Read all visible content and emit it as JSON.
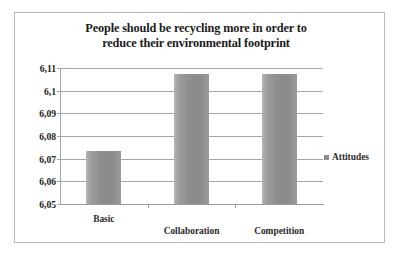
{
  "figure": {
    "border_color": "#b9b9b9",
    "background": "#ffffff"
  },
  "chart_data": {
    "type": "bar",
    "title": "People should be recycling more in order to reduce their environmental footprint",
    "title_lines": [
      "People should be recycling more in order to",
      "reduce their environmental footprint"
    ],
    "categories": [
      "Basic",
      "Collaboration",
      "Competition"
    ],
    "series": [
      {
        "name": "Attitudes",
        "values": [
          6.0735,
          6.1075,
          6.1075
        ],
        "color": "#8e8e8e"
      }
    ],
    "values": [
      6.0735,
      6.1075,
      6.1075
    ],
    "xlabel": "",
    "ylabel": "",
    "ylim": [
      6.05,
      6.11
    ],
    "ytick_labels": [
      "6,11",
      "6,1",
      "6,09",
      "6,08",
      "6,07",
      "6,06",
      "6,05"
    ],
    "ytick_values": [
      6.11,
      6.1,
      6.09,
      6.08,
      6.07,
      6.06,
      6.05
    ],
    "decimal_separator": ",",
    "grid": true,
    "grid_color": "#a6a6a6",
    "legend": {
      "position": "right",
      "entries": [
        "Attitudes"
      ]
    }
  }
}
